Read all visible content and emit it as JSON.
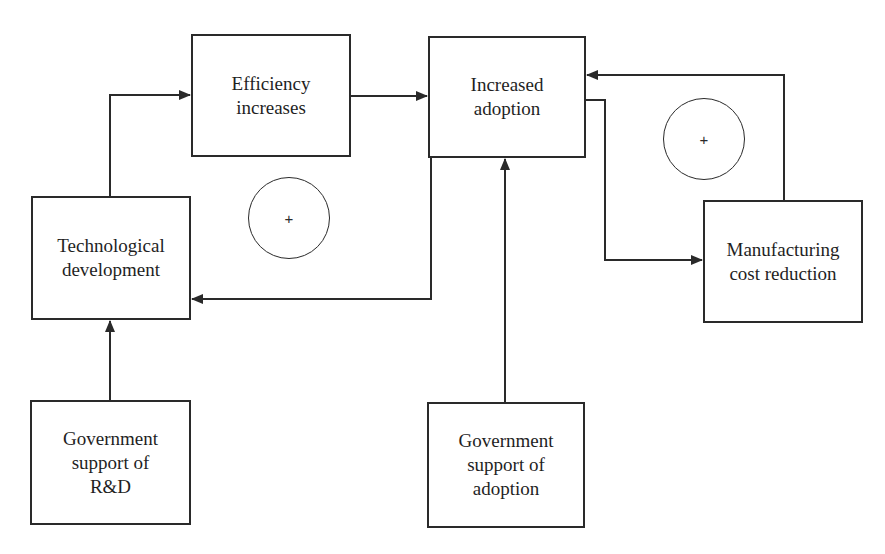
{
  "diagram": {
    "type": "causal-loop",
    "colors": {
      "line": "#2a2a2a",
      "text": "#1f1f1f",
      "background": "#ffffff"
    },
    "nodes": [
      {
        "id": "tech_dev",
        "label": "Technological\ndevelopment",
        "x": 31,
        "y": 196,
        "w": 160,
        "h": 124
      },
      {
        "id": "efficiency",
        "label": "Efficiency\nincreases",
        "x": 191,
        "y": 34,
        "w": 160,
        "h": 123
      },
      {
        "id": "adoption",
        "label": "Increased\nadoption",
        "x": 428,
        "y": 36,
        "w": 158,
        "h": 122
      },
      {
        "id": "mfg_cost",
        "label": "Manufacturing\ncost reduction",
        "x": 703,
        "y": 200,
        "w": 160,
        "h": 123
      },
      {
        "id": "gov_rd",
        "label": "Government\nsupport of\nR&D",
        "x": 30,
        "y": 400,
        "w": 161,
        "h": 125
      },
      {
        "id": "gov_adoption",
        "label": "Government\nsupport of\nadoption",
        "x": 427,
        "y": 402,
        "w": 158,
        "h": 126
      }
    ],
    "loops": [
      {
        "id": "loop_left",
        "symbol": "+",
        "cx": 289,
        "cy": 218,
        "r": 41
      },
      {
        "id": "loop_right",
        "symbol": "+",
        "cx": 704,
        "cy": 139,
        "r": 41
      }
    ],
    "edges": [
      {
        "from": "tech_dev",
        "to": "efficiency",
        "points": [
          [
            110,
            196
          ],
          [
            110,
            95
          ],
          [
            190,
            95
          ]
        ]
      },
      {
        "from": "efficiency",
        "to": "adoption",
        "points": [
          [
            351,
            96
          ],
          [
            427,
            96
          ]
        ]
      },
      {
        "from": "adoption",
        "to": "tech_dev",
        "points": [
          [
            431,
            158
          ],
          [
            431,
            299
          ],
          [
            192,
            299
          ]
        ]
      },
      {
        "from": "gov_rd",
        "to": "tech_dev",
        "points": [
          [
            110,
            400
          ],
          [
            110,
            321
          ]
        ]
      },
      {
        "from": "gov_adoption",
        "to": "adoption",
        "points": [
          [
            505,
            402
          ],
          [
            505,
            159
          ]
        ]
      },
      {
        "from": "adoption",
        "to": "mfg_cost",
        "points": [
          [
            586,
            100
          ],
          [
            605,
            100
          ],
          [
            605,
            260
          ],
          [
            702,
            260
          ]
        ]
      },
      {
        "from": "mfg_cost",
        "to": "adoption",
        "points": [
          [
            784,
            200
          ],
          [
            784,
            75
          ],
          [
            587,
            75
          ]
        ]
      }
    ]
  }
}
